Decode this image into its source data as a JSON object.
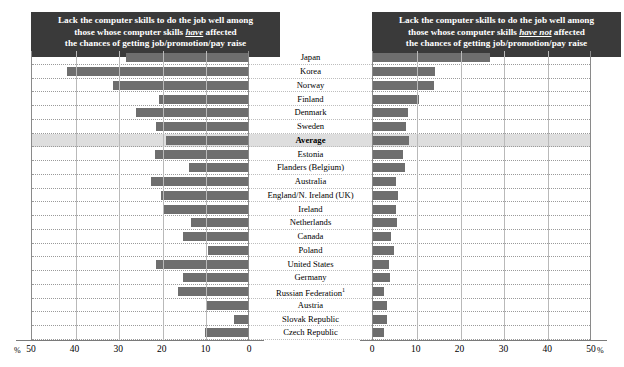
{
  "panels": {
    "left": {
      "title_line1": "Lack the computer skills to do the job well among",
      "title_line2_pre": "those whose computer skills ",
      "title_line2_em": "have",
      "title_line2_post": " affected",
      "title_line3": "the chances of getting job/promotion/pay raise"
    },
    "right": {
      "title_line1": "Lack the computer skills to do the job well among",
      "title_line2_pre": "those whose computer skills ",
      "title_line2_em": "have not",
      "title_line2_post": " affected",
      "title_line3": "the chances of getting job/promotion/pay raise"
    }
  },
  "axis": {
    "percent_symbol_left": "%",
    "percent_symbol_right": "%",
    "left_ticks": [
      "50",
      "40",
      "30",
      "20",
      "10",
      "0"
    ],
    "right_ticks": [
      "0",
      "10",
      "20",
      "30",
      "40",
      "50"
    ]
  },
  "chart_data": {
    "type": "bar",
    "orientation": "horizontal-diverging",
    "xlabel": "%",
    "ylabel": "",
    "xlim_left": [
      0,
      50
    ],
    "xlim_right": [
      0,
      50
    ],
    "grid": true,
    "legend_position": "none",
    "highlight_category": "Average",
    "footnote_marker": "1",
    "categories": [
      "Japan",
      "Korea",
      "Norway",
      "Finland",
      "Denmark",
      "Sweden",
      "Average",
      "Estonia",
      "Flanders (Belgium)",
      "Australia",
      "England/N. Ireland (UK)",
      "Ireland",
      "Netherlands",
      "Canada",
      "Poland",
      "United States",
      "Germany",
      "Russian Federation",
      "Austria",
      "Slovak Republic",
      "Czech Republic"
    ],
    "series": [
      {
        "name": "Computer skills have affected chances of getting job/promotion/pay raise",
        "side": "left",
        "values": [
          28.0,
          41.5,
          31.0,
          20.5,
          25.7,
          21.0,
          18.7,
          21.3,
          13.5,
          22.2,
          20.0,
          19.5,
          13.0,
          15.0,
          9.2,
          21.0,
          15.0,
          16.1,
          9.4,
          3.2,
          9.9
        ]
      },
      {
        "name": "Computer skills have not affected chances of getting job/promotion/pay raise",
        "side": "right",
        "values": [
          26.8,
          14.1,
          13.9,
          10.6,
          8.1,
          7.6,
          8.3,
          6.8,
          7.4,
          5.2,
          5.8,
          5.2,
          5.4,
          4.2,
          4.7,
          3.7,
          3.8,
          2.6,
          3.2,
          3.2,
          2.4
        ]
      }
    ]
  },
  "colors": {
    "bar": "#6e6e6e",
    "header_bg": "#3a3a3a",
    "header_text": "#ffffff",
    "highlight_row": "#dedede",
    "gridline": "#b9b9b9"
  }
}
